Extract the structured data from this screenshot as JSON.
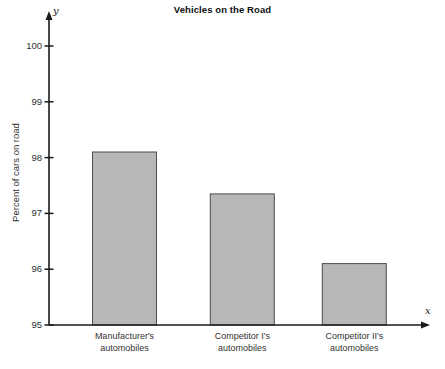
{
  "chart_data": {
    "type": "bar",
    "title": "Vehicles on the Road",
    "ylabel": "Percent of cars on road",
    "xlabel": "",
    "x_axis_symbol": "x",
    "y_axis_symbol": "y",
    "categories": [
      "Manufacturer's\nautomobiles",
      "Competitor I's\nautomobiles",
      "Competitor II's\nautomobiles"
    ],
    "values": [
      98.1,
      97.35,
      96.1
    ],
    "ylim": [
      95,
      100.5
    ],
    "yticks": [
      95,
      96,
      97,
      98,
      99,
      100
    ],
    "grid": false,
    "legend": false,
    "colors": {
      "bar_fill": "#b7b7b7",
      "bar_border": "#4d4d4d",
      "axis": "#1a1a1a",
      "text": "#2e2e2e"
    }
  }
}
